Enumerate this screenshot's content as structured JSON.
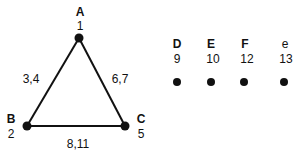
{
  "triangle": {
    "vertices": [
      {
        "id": "A",
        "name": "A",
        "value": "1",
        "x": 79,
        "y": 38
      },
      {
        "id": "B",
        "name": "B",
        "value": "2",
        "x": 27,
        "y": 126
      },
      {
        "id": "C",
        "name": "C",
        "value": "5",
        "x": 125,
        "y": 126
      }
    ],
    "edges": [
      {
        "from": "A",
        "to": "B",
        "label": "3,4"
      },
      {
        "from": "A",
        "to": "C",
        "label": "6,7"
      },
      {
        "from": "B",
        "to": "C",
        "label": "8,11"
      }
    ]
  },
  "isolated_points": [
    {
      "name": "D",
      "value": "9",
      "x": 177,
      "y": 82
    },
    {
      "name": "E",
      "value": "10",
      "x": 211,
      "y": 82
    },
    {
      "name": "F",
      "value": "12",
      "x": 244,
      "y": 82
    },
    {
      "name": "e",
      "value": "13",
      "x": 284,
      "y": 82
    }
  ],
  "colors": {
    "stroke": "#111111",
    "background": "#ffffff"
  }
}
